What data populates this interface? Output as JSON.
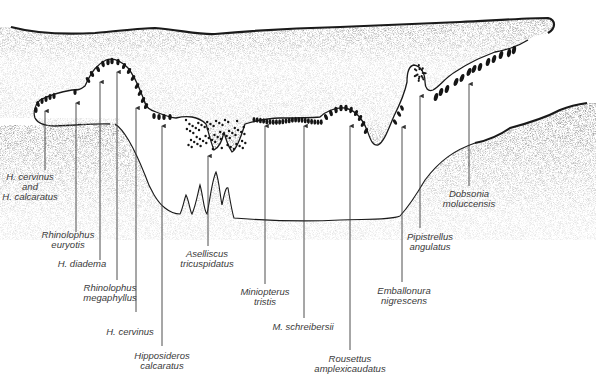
{
  "figure": {
    "colors": {
      "ink": "#1a1a1a",
      "stipple": "#8a8a8a",
      "label": "#3a3a3a",
      "background": "#ffffff"
    }
  },
  "labels": [
    {
      "id": "h-cervinus-calcaratus",
      "lines": [
        "H. cervinus",
        "and",
        "H. calcaratus"
      ]
    },
    {
      "id": "rhinolophus-euryotis",
      "lines": [
        "Rhinolophus",
        "euryotis"
      ]
    },
    {
      "id": "h-diadema",
      "lines": [
        "H. diadema"
      ]
    },
    {
      "id": "rhinolophus-megaphyllus",
      "lines": [
        "Rhinolophus",
        "megaphyllus"
      ]
    },
    {
      "id": "h-cervinus",
      "lines": [
        "H. cervinus"
      ]
    },
    {
      "id": "hipposideros-calcaratus",
      "lines": [
        "Hipposideros",
        "calcaratus"
      ]
    },
    {
      "id": "aselliscus-tricuspidatus",
      "lines": [
        "Aselliscus",
        "tricuspidatus"
      ]
    },
    {
      "id": "miniopterus-tristis",
      "lines": [
        "Miniopterus",
        "tristis"
      ]
    },
    {
      "id": "m-schreibersii",
      "lines": [
        "M. schreibersii"
      ]
    },
    {
      "id": "rousettus-amplexicaudatus",
      "lines": [
        "Rousettus",
        "amplexicaudatus"
      ]
    },
    {
      "id": "emballonura-nigrescens",
      "lines": [
        "Emballonura",
        "nigrescens"
      ]
    },
    {
      "id": "pipistrellus-angulatus",
      "lines": [
        "Pipistrellus",
        "angulatus"
      ]
    },
    {
      "id": "dobsonia-moluccensis",
      "lines": [
        "Dobsonia",
        "moluccensis"
      ]
    }
  ]
}
